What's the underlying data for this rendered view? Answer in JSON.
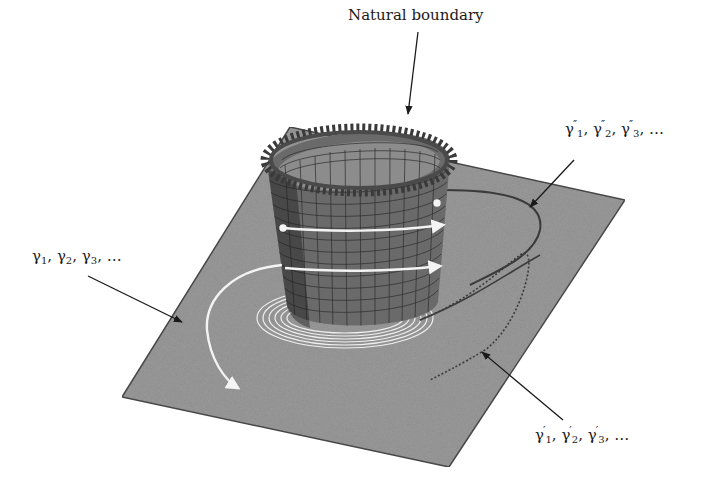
{
  "figure": {
    "labels": {
      "natural_boundary": "Natural boundary",
      "gamma": {
        "symbol": "γ",
        "subs": [
          "1",
          "2",
          "3"
        ],
        "prime": "",
        "ellipsis": "…"
      },
      "gamma_prime": {
        "symbol": "γ",
        "subs": [
          "1",
          "2",
          "3"
        ],
        "prime": "′",
        "ellipsis": "…"
      },
      "gamma_double_prime": {
        "symbol": "γ",
        "subs": [
          "1",
          "2",
          "3"
        ],
        "prime": "″",
        "ellipsis": "…"
      }
    },
    "colors": {
      "plane": "#9a9a9a",
      "plane_edge": "#4a4a4a",
      "surface": "#6e6e6e",
      "grid": "#2e2e2e",
      "boundary_teeth": "#3a3a3a",
      "white_paths": "#f4f4f4",
      "dark_paths": "#3c3c3c",
      "arrows": "#1a1a1a"
    }
  }
}
